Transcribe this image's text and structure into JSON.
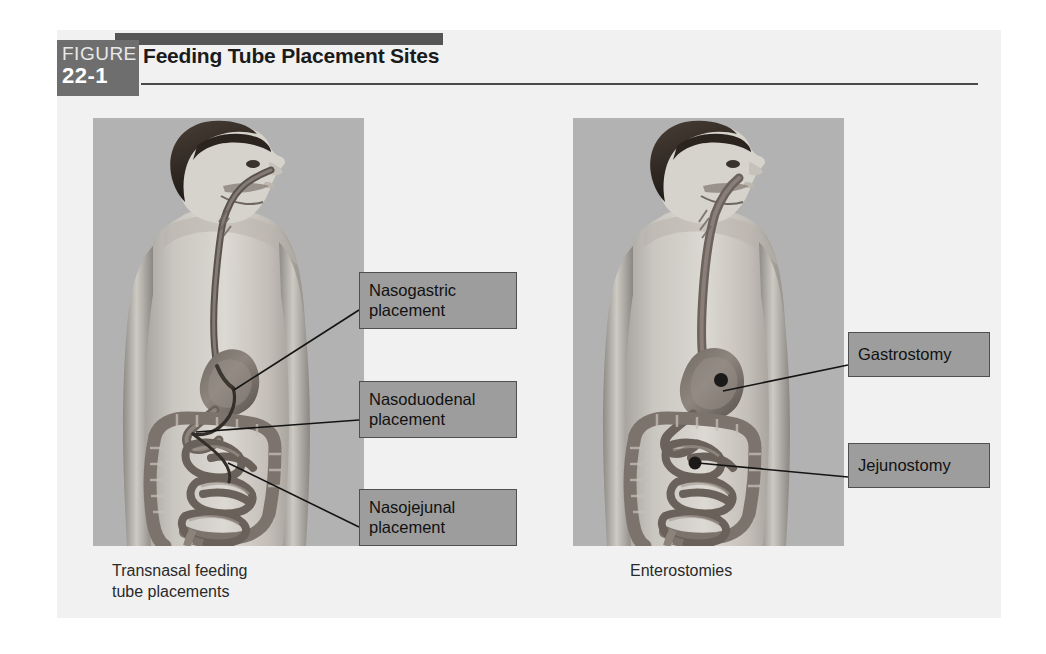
{
  "figure": {
    "badge_word": "FIGURE",
    "badge_number": "22-1",
    "title": "Feeding Tube Placement Sites"
  },
  "panels": [
    {
      "id": "transnasal",
      "caption_line1": "Transnasal feeding",
      "caption_line2": "tube placements",
      "callouts": [
        {
          "id": "nasogastric",
          "line1": "Nasogastric",
          "line2": "placement"
        },
        {
          "id": "nasoduodenal",
          "line1": "Nasoduodenal",
          "line2": "placement"
        },
        {
          "id": "nasojejunal",
          "line1": "Nasojejunal",
          "line2": "placement"
        }
      ]
    },
    {
      "id": "enterostomies",
      "caption_line1": "Enterostomies",
      "caption_line2": "",
      "callouts": [
        {
          "id": "gastrostomy",
          "line1": "Gastrostomy",
          "line2": ""
        },
        {
          "id": "jejunostomy",
          "line1": "Jejunostomy",
          "line2": ""
        }
      ]
    }
  ],
  "colors": {
    "page_background": "#ffffff",
    "panel_background": "#f1f1f1",
    "illustration_background": "#b2b2b2",
    "badge_gray": "#6e6e6e",
    "accent_bar": "#555555",
    "callout_fill": "#9d9d9d",
    "callout_border": "#4f4f4f",
    "leader_line": "#141414",
    "title_text": "#1b1b1b"
  }
}
